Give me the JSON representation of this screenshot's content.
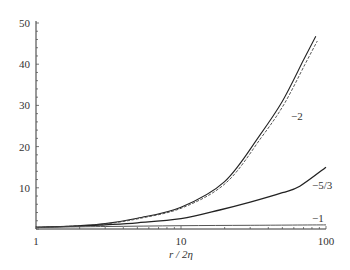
{
  "chart_data": {
    "type": "line",
    "title": "",
    "xlabel": "r / 2η",
    "ylabel": "",
    "xscale": "log",
    "xlim": [
      1,
      100
    ],
    "ylim": [
      0,
      50
    ],
    "grid": false,
    "legend": "inline labels",
    "x_ticks": [
      {
        "value": 1,
        "label": "1"
      },
      {
        "value": 10,
        "label": "10"
      },
      {
        "value": 100,
        "label": "100"
      }
    ],
    "y_ticks": [
      {
        "value": 10,
        "label": "10"
      },
      {
        "value": 20,
        "label": "20"
      },
      {
        "value": 30,
        "label": "30"
      },
      {
        "value": 40,
        "label": "40"
      },
      {
        "value": 50,
        "label": "50"
      }
    ],
    "series": [
      {
        "name": "-2",
        "label": "−2",
        "style": "solid+dashed pair",
        "x": [
          1,
          2,
          3,
          5,
          10,
          20,
          35,
          50,
          70,
          85
        ],
        "y": [
          0.4,
          0.8,
          1.3,
          2.6,
          5.3,
          11.5,
          22.8,
          31,
          41,
          46.8
        ]
      },
      {
        "name": "-5/3",
        "label": "−5/3",
        "style": "solid",
        "x": [
          1,
          2,
          3,
          5,
          10,
          18.5,
          30,
          50,
          66,
          100
        ],
        "y": [
          0.4,
          0.7,
          1.0,
          1.5,
          2.5,
          4.6,
          6.5,
          8.8,
          10.4,
          15
        ]
      },
      {
        "name": "-1",
        "label": "−1",
        "style": "solid",
        "x": [
          1,
          3,
          10,
          30,
          100
        ],
        "y": [
          0.4,
          0.6,
          0.8,
          0.9,
          1.0
        ]
      }
    ]
  }
}
